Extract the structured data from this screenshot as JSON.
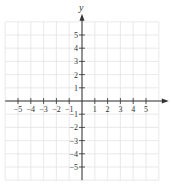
{
  "chart_data": {
    "type": "scatter",
    "title": "",
    "xlabel": "x",
    "ylabel": "y",
    "xlim": [
      -6,
      6
    ],
    "ylim": [
      -6,
      6
    ],
    "grid": true,
    "x_ticks": [
      -5,
      -4,
      -3,
      -2,
      -1,
      1,
      2,
      3,
      4,
      5
    ],
    "y_ticks": [
      5,
      4,
      3,
      2,
      1,
      -1,
      -2,
      -3,
      -4,
      -5
    ],
    "x_tick_labels": [
      "−5",
      "−4",
      "−3",
      "−2",
      "−1",
      "1",
      "2",
      "3",
      "4",
      "5"
    ],
    "y_tick_labels": [
      "5",
      "4",
      "3",
      "2",
      "1",
      "−1",
      "−2",
      "−3",
      "−4",
      "−5"
    ],
    "series": [],
    "colors": {
      "grid": "#e3e3e3",
      "axis": "#333333",
      "text": "#333333"
    }
  },
  "layout": {
    "origin_x": 82,
    "origin_y": 101,
    "unit_x": 12.8,
    "unit_y": 13.2
  }
}
